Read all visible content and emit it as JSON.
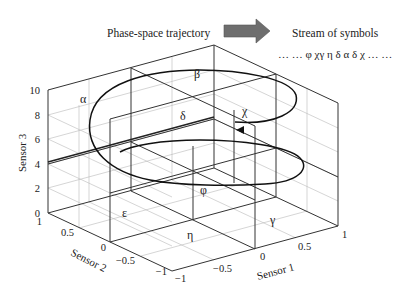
{
  "header": {
    "left_label": "Phase-space trajectory",
    "right_label": "Stream of symbols",
    "symbol_stream": "… … φ χγ η δ α δ χ … …",
    "arrow_icon": "right-arrow",
    "arrow_color": "#6e6e6e"
  },
  "axes": {
    "x": {
      "label": "Sensor 1",
      "ticks": [
        "−1",
        "−0.5",
        "0",
        "0.5",
        "1"
      ],
      "range": [
        -1,
        1
      ]
    },
    "y": {
      "label": "Sensor 2",
      "ticks": [
        "−1",
        "−0.5",
        "0",
        "0.5",
        "1"
      ],
      "range": [
        -1,
        1
      ]
    },
    "z": {
      "label": "Sensor 3",
      "ticks": [
        "0",
        "2",
        "4",
        "6",
        "8",
        "10"
      ],
      "range": [
        0,
        10
      ]
    }
  },
  "regions": {
    "alpha": "α",
    "beta": "β",
    "delta": "δ",
    "chi": "χ",
    "phi": "φ",
    "gamma": "γ",
    "eta": "η",
    "epsilon": "ε"
  },
  "colors": {
    "frame": "#333333",
    "grid": "#b8b8b8",
    "trajectory": "#111111"
  }
}
